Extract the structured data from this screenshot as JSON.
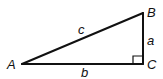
{
  "diagram": {
    "type": "right-triangle",
    "stroke_color": "#111111",
    "background": "#ffffff",
    "vertices": {
      "A": {
        "label": "A",
        "x": 22,
        "y": 64
      },
      "B": {
        "label": "B",
        "x": 143,
        "y": 13
      },
      "C": {
        "label": "C",
        "x": 143,
        "y": 64
      }
    },
    "sides": {
      "a": {
        "label": "a",
        "from": "B",
        "to": "C"
      },
      "b": {
        "label": "b",
        "from": "A",
        "to": "C"
      },
      "c": {
        "label": "c",
        "from": "A",
        "to": "B"
      }
    },
    "right_angle_at": "C"
  }
}
